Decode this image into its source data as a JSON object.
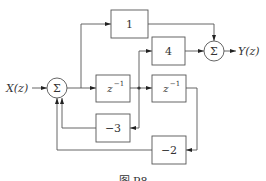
{
  "diagram": {
    "type": "signal-flow block diagram",
    "input": {
      "label": "X(z)"
    },
    "output": {
      "label": "Y(z)"
    },
    "summers": [
      {
        "id": "sum1",
        "symbol": "Σ"
      },
      {
        "id": "sum2",
        "symbol": "Σ"
      }
    ],
    "blocks": [
      {
        "id": "b_gain1",
        "label": "1"
      },
      {
        "id": "b_gain4",
        "label": "4"
      },
      {
        "id": "b_delay1",
        "label_base": "z",
        "label_exp": "−1"
      },
      {
        "id": "b_delay2",
        "label_base": "z",
        "label_exp": "−1"
      },
      {
        "id": "b_gain_m3",
        "label": "−3"
      },
      {
        "id": "b_gain_m2",
        "label": "−2"
      }
    ],
    "caption": "图 P8"
  }
}
